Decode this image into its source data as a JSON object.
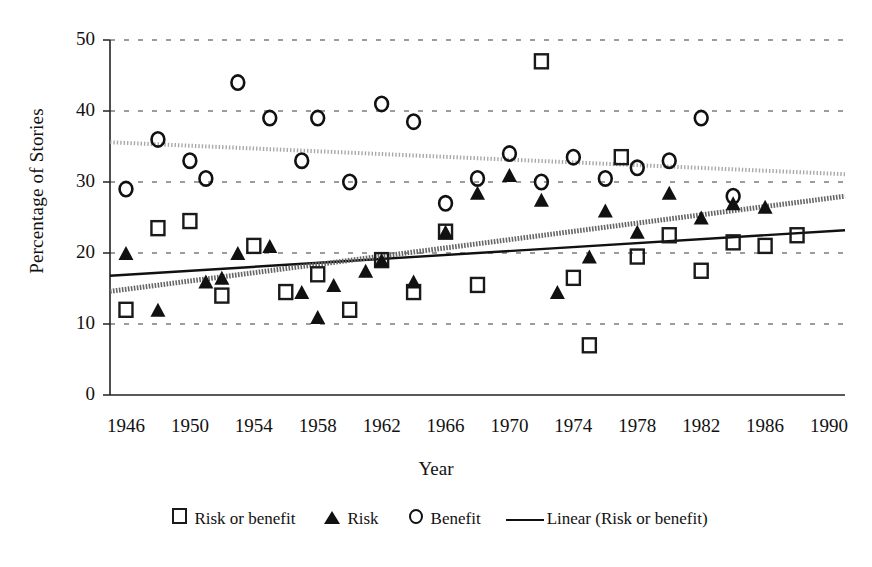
{
  "chart_data": {
    "type": "scatter",
    "title": "",
    "xlabel": "Year",
    "ylabel": "Percentage of Stories",
    "xlim": [
      1945,
      1991
    ],
    "ylim": [
      0,
      50
    ],
    "yticks": [
      0,
      10,
      20,
      30,
      40,
      50
    ],
    "xticks": [
      1946,
      1950,
      1954,
      1958,
      1962,
      1966,
      1970,
      1974,
      1978,
      1982,
      1986,
      1990
    ],
    "grid": "horizontal-dashed",
    "legend_position": "bottom-center",
    "series": [
      {
        "name": "Risk or benefit",
        "marker": "open-square",
        "color": "#1a1a1a",
        "points": [
          [
            1946,
            12
          ],
          [
            1948,
            23.5
          ],
          [
            1950,
            24.5
          ],
          [
            1952,
            14
          ],
          [
            1954,
            21
          ],
          [
            1956,
            14.5
          ],
          [
            1958,
            17
          ],
          [
            1960,
            12
          ],
          [
            1962,
            19
          ],
          [
            1964,
            14.5
          ],
          [
            1966,
            23
          ],
          [
            1968,
            15.5
          ],
          [
            1972,
            47
          ],
          [
            1974,
            16.5
          ],
          [
            1975,
            7
          ],
          [
            1977,
            33.5
          ],
          [
            1978,
            19.5
          ],
          [
            1980,
            22.5
          ],
          [
            1982,
            17.5
          ],
          [
            1984,
            21.5
          ],
          [
            1986,
            21
          ],
          [
            1988,
            22.5
          ]
        ]
      },
      {
        "name": "Risk",
        "marker": "filled-triangle",
        "color": "#111111",
        "points": [
          [
            1946,
            20
          ],
          [
            1948,
            12
          ],
          [
            1951,
            16
          ],
          [
            1952,
            16.5
          ],
          [
            1953,
            20
          ],
          [
            1955,
            21
          ],
          [
            1957,
            14.5
          ],
          [
            1958,
            11
          ],
          [
            1959,
            15.5
          ],
          [
            1961,
            17.5
          ],
          [
            1962,
            19
          ],
          [
            1964,
            16
          ],
          [
            1966,
            23
          ],
          [
            1968,
            28.5
          ],
          [
            1970,
            31
          ],
          [
            1972,
            27.5
          ],
          [
            1973,
            14.5
          ],
          [
            1975,
            19.5
          ],
          [
            1976,
            26
          ],
          [
            1978,
            23
          ],
          [
            1980,
            28.5
          ],
          [
            1982,
            25
          ],
          [
            1984,
            27
          ],
          [
            1986,
            26.5
          ]
        ]
      },
      {
        "name": "Benefit",
        "marker": "open-circle",
        "color": "#111111",
        "points": [
          [
            1946,
            29
          ],
          [
            1948,
            36
          ],
          [
            1950,
            33
          ],
          [
            1951,
            30.5
          ],
          [
            1953,
            44
          ],
          [
            1955,
            39
          ],
          [
            1957,
            33
          ],
          [
            1958,
            39
          ],
          [
            1960,
            30
          ],
          [
            1962,
            41
          ],
          [
            1964,
            38.5
          ],
          [
            1966,
            27
          ],
          [
            1968,
            30.5
          ],
          [
            1970,
            34
          ],
          [
            1972,
            30
          ],
          [
            1974,
            33.5
          ],
          [
            1976,
            30.5
          ],
          [
            1978,
            32
          ],
          [
            1980,
            33
          ],
          [
            1982,
            39
          ],
          [
            1984,
            28
          ]
        ]
      }
    ],
    "trendlines": [
      {
        "name": "Linear (Risk or benefit)",
        "style": "solid",
        "color": "#111111",
        "from": [
          1945,
          16.8
        ],
        "to": [
          1991,
          23.2
        ]
      },
      {
        "name": "Linear (Risk)",
        "style": "hatched",
        "color": "#666666",
        "from": [
          1945,
          14.6
        ],
        "to": [
          1991,
          28.0
        ]
      },
      {
        "name": "Linear (Benefit)",
        "style": "hatched-light",
        "color": "#9a9a9a",
        "from": [
          1945,
          35.6
        ],
        "to": [
          1991,
          31.1
        ]
      }
    ]
  },
  "axis": {
    "y_title": "Percentage of Stories",
    "x_title": "Year",
    "y_ticks": [
      "50",
      "40",
      "30",
      "20",
      "10",
      "0"
    ],
    "x_ticks": [
      "1946",
      "1950",
      "1954",
      "1958",
      "1962",
      "1966",
      "1970",
      "1974",
      "1978",
      "1982",
      "1986",
      "1990"
    ]
  },
  "legend": {
    "items": [
      {
        "label": "Risk or benefit",
        "symbol": "open-square"
      },
      {
        "label": "Risk",
        "symbol": "filled-triangle"
      },
      {
        "label": "Benefit",
        "symbol": "open-circle"
      },
      {
        "label": "Linear (Risk or benefit)",
        "symbol": "solid-line"
      }
    ]
  }
}
